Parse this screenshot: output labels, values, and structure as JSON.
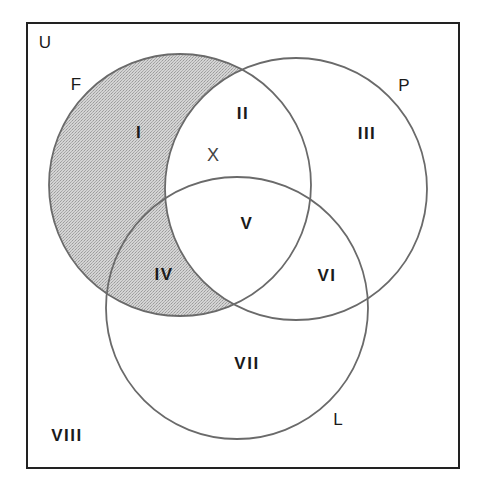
{
  "diagram": {
    "type": "venn",
    "universe": {
      "label": "U",
      "region_outside_label": "VIII",
      "rect": {
        "x": 27,
        "y": 23,
        "width": 432,
        "height": 445
      }
    },
    "sets": [
      {
        "name": "F",
        "label": "F",
        "cx": 180,
        "cy": 185,
        "r": 131,
        "shaded": true
      },
      {
        "name": "P",
        "label": "P",
        "cx": 296,
        "cy": 189,
        "r": 131,
        "shaded": false
      },
      {
        "name": "L",
        "label": "L",
        "cx": 237,
        "cy": 308,
        "r": 131,
        "shaded": false
      }
    ],
    "regions": [
      {
        "id": "I",
        "label": "I",
        "description": "F only",
        "shaded": true
      },
      {
        "id": "II",
        "label": "II",
        "description": "F and P only",
        "shaded": false
      },
      {
        "id": "III",
        "label": "III",
        "description": "P only",
        "shaded": false
      },
      {
        "id": "IV",
        "label": "IV",
        "description": "F and L only",
        "shaded": true
      },
      {
        "id": "V",
        "label": "V",
        "description": "F, P and L",
        "shaded": false
      },
      {
        "id": "VI",
        "label": "VI",
        "description": "P and L only",
        "shaded": false
      },
      {
        "id": "VII",
        "label": "VII",
        "description": "L only",
        "shaded": false
      },
      {
        "id": "VIII",
        "label": "VIII",
        "description": "none",
        "shaded": false
      }
    ],
    "marker": {
      "label": "X",
      "region": "II"
    },
    "colors": {
      "border": "#222222",
      "circle_stroke": "#6a6a6a",
      "shade": "#c9c9c9",
      "shade_dot": "#9a9a9a",
      "background": "#ffffff"
    }
  },
  "labels": {
    "U": "U",
    "F": "F",
    "P": "P",
    "L": "L",
    "X": "X",
    "I": "I",
    "II": "II",
    "III": "III",
    "IV": "IV",
    "V": "V",
    "VI": "VI",
    "VII": "VII",
    "VIII": "VIII"
  }
}
